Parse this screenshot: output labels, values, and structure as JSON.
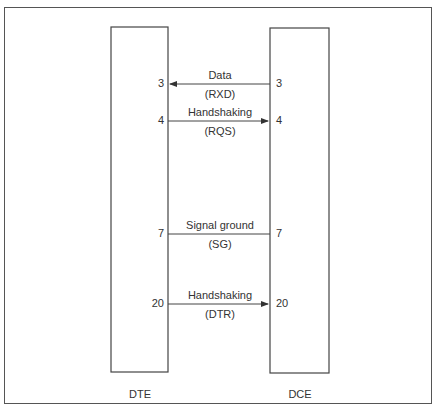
{
  "diagram": {
    "left_device": {
      "label": "DTE"
    },
    "right_device": {
      "label": "DCE"
    },
    "signals": [
      {
        "pin_left": "3",
        "pin_right": "3",
        "name": "Data",
        "abbr": "(RXD)",
        "direction": "DCE-to-DTE"
      },
      {
        "pin_left": "4",
        "pin_right": "4",
        "name": "Handshaking",
        "abbr": "(RQS)",
        "direction": "DTE-to-DCE"
      },
      {
        "pin_left": "7",
        "pin_right": "7",
        "name": "Signal ground",
        "abbr": "(SG)",
        "direction": "none"
      },
      {
        "pin_left": "20",
        "pin_right": "20",
        "name": "Handshaking",
        "abbr": "(DTR)",
        "direction": "DTE-to-DCE"
      }
    ],
    "colors": {
      "line": "#444444",
      "text": "#333333",
      "background": "#ffffff"
    }
  }
}
